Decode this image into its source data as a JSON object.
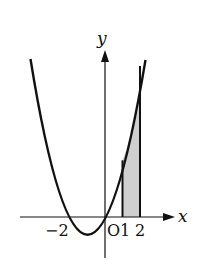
{
  "figure": {
    "function": "y = x^2 + 2x",
    "x_axis_label": "x",
    "y_axis_label": "y",
    "origin_label": "O",
    "tick_labels": [
      "-2",
      "1",
      "2"
    ],
    "tick_label_minus2": "−2",
    "tick_label_1": "1",
    "tick_label_2": "2",
    "shaded_region": {
      "from_x": 1,
      "to_x": 2,
      "fill": "#cfcfcf"
    },
    "colors": {
      "curve": "#111111",
      "axis": "#111111",
      "shade": "#cfcfcf",
      "background": "#ffffff"
    }
  }
}
